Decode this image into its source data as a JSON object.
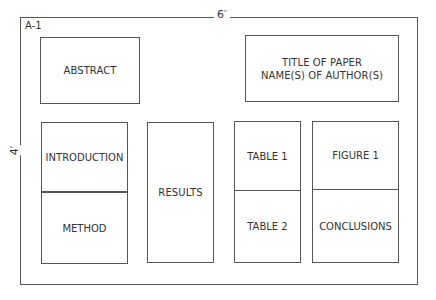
{
  "poster": {
    "panel_id": "A-1",
    "width_label": "6′",
    "height_label": "4′",
    "sections": {
      "abstract": "ABSTRACT",
      "title_line1": "TITLE OF PAPER",
      "title_line2": "NAME(S) OF AUTHOR(S)",
      "introduction": "INTRODUCTION",
      "method": "METHOD",
      "results": "RESULTS",
      "table1": "TABLE 1",
      "table2": "TABLE 2",
      "figure1": "FIGURE 1",
      "conclusions": "CONCLUSIONS"
    }
  }
}
